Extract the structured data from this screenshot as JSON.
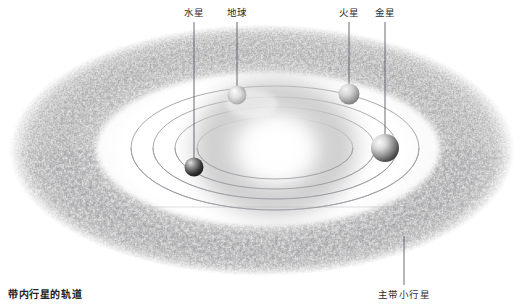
{
  "diagram": {
    "title_alt": "",
    "background_color": "#ffffff",
    "width": 525,
    "height": 306
  },
  "labels": {
    "mercury": "水星",
    "earth": "地球",
    "mars": "火星",
    "venus": "金星",
    "inner_orbits": "带内行星的轨道",
    "main_belt": "主带小行星"
  },
  "label_positions": {
    "mercury": {
      "x": 194,
      "y": 7
    },
    "earth": {
      "x": 237,
      "y": 7
    },
    "mars": {
      "x": 349,
      "y": 7
    },
    "venus": {
      "x": 385,
      "y": 7
    },
    "inner_orbits": {
      "x": 8,
      "y": 289
    },
    "main_belt": {
      "x": 404,
      "y": 289
    }
  },
  "leader_lines": [
    {
      "name": "mercury-leader",
      "x1": 194,
      "y1": 22,
      "x2": 194,
      "y2": 166
    },
    {
      "name": "earth-leader",
      "x1": 237,
      "y1": 22,
      "x2": 237,
      "y2": 97
    },
    {
      "name": "mars-leader",
      "x1": 349,
      "y1": 22,
      "x2": 349,
      "y2": 88
    },
    {
      "name": "venus-leader",
      "x1": 385,
      "y1": 22,
      "x2": 385,
      "y2": 143
    },
    {
      "name": "main-belt-leader",
      "x1": 404,
      "y1": 236,
      "x2": 404,
      "y2": 285
    },
    {
      "name": "inner-orbits-leader",
      "x1": 60,
      "y1": 207,
      "x2": 455,
      "y2": 207
    }
  ],
  "sun": {
    "name": "sun",
    "cx": 275,
    "cy": 148,
    "rx": 92,
    "ry": 78,
    "core_color": "#ffffff",
    "halo_color": "#b9b9b9"
  },
  "planets": [
    {
      "name": "mercury",
      "label": "水星",
      "cx": 194,
      "cy": 167,
      "r": 9.5,
      "light_color": "#d8d8d8",
      "dark_color": "#1c1c1c"
    },
    {
      "name": "earth",
      "label": "地球",
      "cx": 237,
      "cy": 95,
      "r": 9.5,
      "light_color": "#f0f0f0",
      "dark_color": "#3a3a3a"
    },
    {
      "name": "mars",
      "label": "火星",
      "cx": 349,
      "cy": 94,
      "r": 10.5,
      "light_color": "#e8e8e8",
      "dark_color": "#6e6e6e"
    },
    {
      "name": "venus",
      "label": "金星",
      "cx": 385,
      "cy": 148,
      "r": 14,
      "light_color": "#f2f2f2",
      "dark_color": "#2e2e2e"
    }
  ],
  "orbits": [
    {
      "name": "orbit-mercury",
      "rx": 78,
      "ry": 31
    },
    {
      "name": "orbit-venus",
      "rx": 100,
      "ry": 41
    },
    {
      "name": "orbit-earth",
      "rx": 122,
      "ry": 51
    },
    {
      "name": "orbit-mars",
      "rx": 144,
      "ry": 62
    }
  ],
  "asteroid_belt": {
    "name": "main-belt",
    "cx": 262,
    "cy": 150,
    "outer_rx": 253,
    "outer_ry": 126,
    "inner_rx": 176,
    "inner_ry": 80,
    "color_dark": "#676767",
    "color_light": "#b5b5b5",
    "texture": "speckled-grain"
  },
  "colors": {
    "text": "#2b2b2b",
    "leader_line": "#5a5a6a",
    "orbit_line": "#9a9aa2"
  }
}
